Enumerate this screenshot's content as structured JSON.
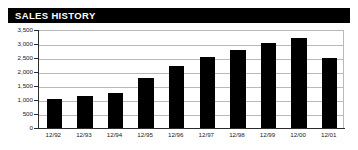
{
  "widget": {
    "title": "SALES HISTORY",
    "background_color": "#ffffff",
    "title_bar_color": "#000000",
    "title_text_color": "#ffffff",
    "bar_color": "#000000",
    "gridline_color": "#b9b9b9",
    "axis_color": "#2b2b2b"
  },
  "chart_data": {
    "type": "bar",
    "title": "SALES HISTORY",
    "xlabel": "",
    "ylabel": "",
    "categories": [
      "12/92",
      "12/93",
      "12/94",
      "12/95",
      "12/96",
      "12/97",
      "12/98",
      "12/99",
      "12/00",
      "12/01"
    ],
    "values": [
      1050,
      1150,
      1250,
      1800,
      2200,
      2550,
      2800,
      3050,
      3200,
      2500
    ],
    "ylim": [
      0,
      3500
    ],
    "yticks": [
      0,
      500,
      1000,
      1500,
      2000,
      2500,
      3000,
      3500
    ],
    "ytick_labels": [
      "0",
      "500",
      "1,000",
      "1,500",
      "2,000",
      "2,500",
      "3,000",
      "3,500"
    ],
    "grid": true,
    "legend": "none"
  }
}
